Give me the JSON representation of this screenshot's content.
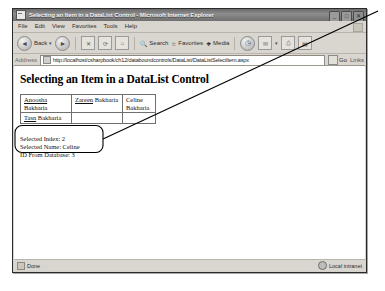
{
  "window": {
    "title": "Selecting an Item in a DataList Control - Microsoft Internet Explorer",
    "icon": "page-icon",
    "buttons": {
      "minimize": "_",
      "maximize": "□",
      "close": "✕"
    }
  },
  "menu": {
    "items": [
      "File",
      "Edit",
      "View",
      "Favorites",
      "Tools",
      "Help"
    ]
  },
  "toolbar": {
    "back_label": "Back",
    "back_icon": "back-arrow-icon",
    "forward_icon": "forward-arrow-icon",
    "stop_icon": "stop-icon",
    "refresh_icon": "refresh-icon",
    "home_icon": "home-icon",
    "search_label": "Search",
    "search_icon": "search-icon",
    "favorites_label": "Favorites",
    "favorites_icon": "star-icon",
    "media_label": "Media",
    "media_icon": "media-icon",
    "history_icon": "history-clock-icon",
    "mail_icon": "mail-icon",
    "print_icon": "print-icon",
    "edit_icon": "edit-page-icon",
    "dropdown_caret": "▾"
  },
  "address": {
    "label": "Address",
    "icon": "page-icon",
    "url": "http://localhost/csharpbook/ch12/databoundcontrols/DataList/DataListSelectItem.aspx",
    "go_label": "Go",
    "go_icon": "go-arrow-icon",
    "links_label": "Links"
  },
  "page": {
    "heading": "Selecting an Item in a DataList Control",
    "datalist": {
      "rows": [
        [
          {
            "link": "Anoosha",
            "text": " Bakharia"
          },
          {
            "link": "Zareen",
            "text": " Bakharia"
          },
          {
            "link": "Celine",
            "text": " Bakharia"
          }
        ],
        [
          {
            "link": "Tasn",
            "text": " Bakharia"
          }
        ]
      ]
    },
    "info": {
      "selected_index": "Selected Index: 2",
      "selected_name": "Selected Name: Celine",
      "id_from_database": "ID From Database: 3"
    }
  },
  "statusbar": {
    "status": "Done",
    "status_icon": "page-icon",
    "zone": "Local intranet",
    "zone_icon": "globe-icon"
  },
  "annotation": {
    "callout_shape": "rounded-rectangle-highlight",
    "leader_line": "diagonal-pointer-line"
  },
  "colors": {
    "window_border": "#2b2b2b",
    "chrome": "#d9d6cf",
    "titlebar_start": "#6a6a6a",
    "titlebar_end": "#6f6f6f",
    "page_background": "#ffffff",
    "text": "#111111",
    "annotation": "#000000"
  }
}
